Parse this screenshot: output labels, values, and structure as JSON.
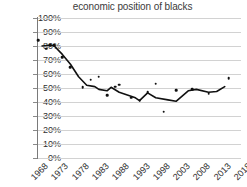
{
  "chart_data": {
    "type": "scatter",
    "title": "economic position of blacks",
    "xlabel": "",
    "ylabel": "",
    "ylim": [
      0,
      100
    ],
    "xlim": [
      1968,
      2018
    ],
    "grid": true,
    "legend": null,
    "yticks": [
      "0%",
      "10%",
      "20%",
      "30%",
      "40%",
      "50%",
      "60%",
      "70%",
      "80%",
      "90%",
      "100%"
    ],
    "ytick_values": [
      0,
      10,
      20,
      30,
      40,
      50,
      60,
      70,
      80,
      90,
      100
    ],
    "xticks": [
      "1968",
      "1973",
      "1978",
      "1983",
      "1988",
      "1993",
      "1998",
      "2003",
      "2008",
      "2013",
      "2018"
    ],
    "xtick_values": [
      1968,
      1973,
      1978,
      1983,
      1988,
      1993,
      1998,
      2003,
      2008,
      2013,
      2018
    ],
    "points": [
      {
        "x": 1968,
        "y": 84
      },
      {
        "x": 1970,
        "y": 78
      },
      {
        "x": 1971,
        "y": 80.5
      },
      {
        "x": 1972,
        "y": 80.5
      },
      {
        "x": 1974,
        "y": 72
      },
      {
        "x": 1976,
        "y": 65
      },
      {
        "x": 1979,
        "y": 50.5
      },
      {
        "x": 1981,
        "y": 56
      },
      {
        "x": 1983,
        "y": 58
      },
      {
        "x": 1985,
        "y": 45
      },
      {
        "x": 1987,
        "y": 51
      },
      {
        "x": 1988,
        "y": 52.5
      },
      {
        "x": 1991,
        "y": 43
      },
      {
        "x": 1993,
        "y": 41
      },
      {
        "x": 1995,
        "y": 47
      },
      {
        "x": 1997,
        "y": 53
      },
      {
        "x": 1999,
        "y": 33
      },
      {
        "x": 2002,
        "y": 48.5
      },
      {
        "x": 2006,
        "y": 49
      },
      {
        "x": 2010,
        "y": 46
      },
      {
        "x": 2015,
        "y": 57
      }
    ],
    "trend": [
      {
        "x": 1969,
        "y": 80
      },
      {
        "x": 1971,
        "y": 80.5
      },
      {
        "x": 1972,
        "y": 80
      },
      {
        "x": 1974,
        "y": 74
      },
      {
        "x": 1976,
        "y": 67
      },
      {
        "x": 1978,
        "y": 58
      },
      {
        "x": 1980,
        "y": 52
      },
      {
        "x": 1982,
        "y": 51
      },
      {
        "x": 1983,
        "y": 49
      },
      {
        "x": 1985,
        "y": 48
      },
      {
        "x": 1986,
        "y": 50.5
      },
      {
        "x": 1988,
        "y": 47
      },
      {
        "x": 1990,
        "y": 45
      },
      {
        "x": 1992,
        "y": 43
      },
      {
        "x": 1993,
        "y": 41
      },
      {
        "x": 1995,
        "y": 46.5
      },
      {
        "x": 1997,
        "y": 43
      },
      {
        "x": 2000,
        "y": 41.5
      },
      {
        "x": 2002,
        "y": 40.5
      },
      {
        "x": 2005,
        "y": 48
      },
      {
        "x": 2007,
        "y": 49
      },
      {
        "x": 2010,
        "y": 47
      },
      {
        "x": 2012,
        "y": 47.5
      },
      {
        "x": 2014,
        "y": 51
      }
    ],
    "colors": {
      "dot": "#111111",
      "trend_line": "#111111",
      "gridline": "#d2d2d2",
      "axis": "#7a7a7a",
      "text": "#2e2e2e",
      "title": "#3b3b3b"
    }
  }
}
